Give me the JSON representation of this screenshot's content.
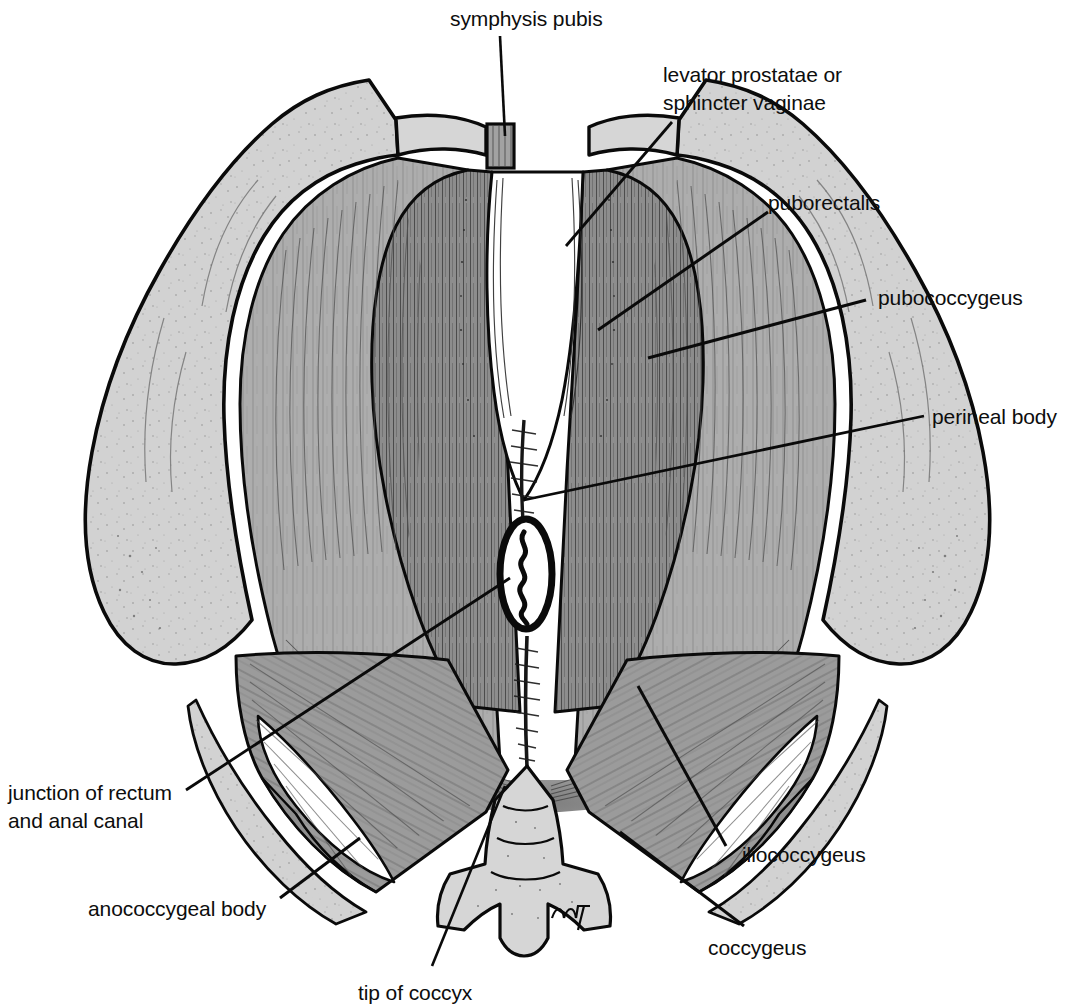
{
  "figure": {
    "type": "anatomical-line-illustration",
    "background_color": "#ffffff",
    "ink_color": "#0a0a0a",
    "bone_fill": "#d2d2d2",
    "muscle_fill": "#9b9b9b",
    "muscle_fill_light": "#b0b0b0",
    "muscle_fill_dark": "#8b8b8b",
    "cavity_fill": "#ffffff",
    "artist_mark": "mark"
  },
  "labels": {
    "symphysis_pubis": "symphysis pubis",
    "levator_prostatae_line1": "levator prostatae or",
    "levator_prostatae_line2": "sphincter vaginae",
    "puborectalis": "puborectalis",
    "pubococcygeus": "pubococcygeus",
    "perineal_body": "perineal body",
    "iliococcygeus": "iliococcygeus",
    "coccygeus": "coccygeus",
    "tip_of_coccyx": "tip of coccyx",
    "anococcygeal_body": "anococcygeal body",
    "junction_rectum_line1": "junction of rectum",
    "junction_rectum_line2": "and anal canal"
  }
}
